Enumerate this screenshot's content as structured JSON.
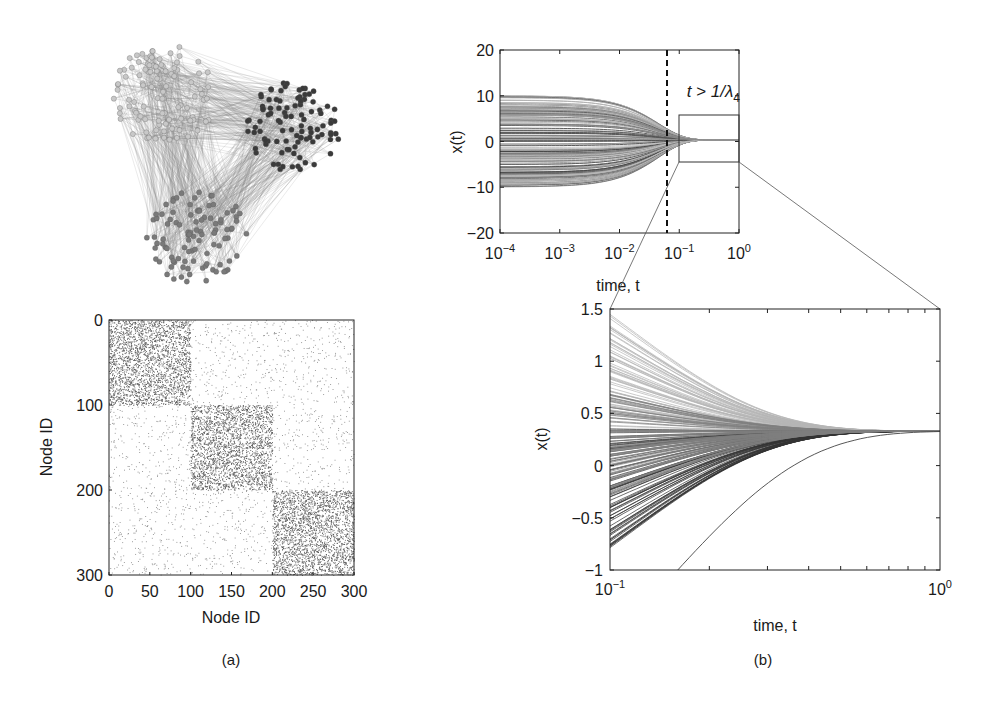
{
  "panels": {
    "a": {
      "label": "(a)"
    },
    "b": {
      "label": "(b)"
    }
  },
  "chart_data": [
    {
      "id": "network",
      "type": "network",
      "title": "",
      "communities": [
        {
          "name": "community-1",
          "nodes": 100,
          "node_color": "#c8c8c8",
          "cx": 165,
          "cy": 95,
          "r": 50
        },
        {
          "name": "community-2",
          "nodes": 100,
          "node_color": "#3a3a3a",
          "cx": 293,
          "cy": 127,
          "r": 45
        },
        {
          "name": "community-3",
          "nodes": 100,
          "node_color": "#7a7a7a",
          "cx": 197,
          "cy": 237,
          "r": 48
        }
      ],
      "edge_color": "#8a8a8a"
    },
    {
      "id": "adjacency",
      "type": "heatmap",
      "title": "",
      "xlabel": "Node ID",
      "ylabel": "Node ID",
      "xlim": [
        0,
        300
      ],
      "ylim": [
        0,
        300
      ],
      "y_inverted": true,
      "xticks": [
        0,
        50,
        100,
        150,
        200,
        250,
        300
      ],
      "yticks": [
        0,
        100,
        200,
        300
      ],
      "blocks": [
        {
          "rows": [
            0,
            100
          ],
          "cols": [
            0,
            100
          ],
          "density": "high"
        },
        {
          "rows": [
            100,
            200
          ],
          "cols": [
            100,
            200
          ],
          "density": "high"
        },
        {
          "rows": [
            200,
            300
          ],
          "cols": [
            200,
            300
          ],
          "density": "high"
        }
      ],
      "off_block_density": "low"
    },
    {
      "id": "consensus-full",
      "type": "line",
      "title": "",
      "xlabel": "time, t",
      "ylabel": "x(t)",
      "xscale": "log",
      "xlim": [
        0.0001,
        1
      ],
      "ylim": [
        -20,
        20
      ],
      "xticks": [
        "10^-4",
        "10^-3",
        "10^-2",
        "10^-1",
        "10^0"
      ],
      "yticks": [
        20,
        10,
        0,
        -10,
        -20
      ],
      "initial_value_range": [
        -10,
        10
      ],
      "final_value": 0.33,
      "annotations": [
        {
          "type": "vline",
          "x": 0.07,
          "style": "dashed"
        },
        {
          "type": "text",
          "text_main": "t > 1/λ",
          "text_sub": "4"
        },
        {
          "type": "zoom-box",
          "x": [
            0.1,
            1
          ],
          "y": [
            -4.5,
            5.5
          ]
        }
      ]
    },
    {
      "id": "consensus-zoom",
      "type": "line",
      "title": "",
      "xlabel": "time, t",
      "ylabel": "x(t)",
      "xscale": "log",
      "xlim": [
        0.1,
        1
      ],
      "ylim": [
        -1,
        1.5
      ],
      "xticks": [
        "10^-1",
        "10^0"
      ],
      "yticks": [
        1.5,
        1,
        0.5,
        0,
        -0.5,
        -1
      ],
      "series_groups": [
        {
          "name": "community-1",
          "color": "#b5b5b5",
          "start_range": [
            0.35,
            1.45
          ]
        },
        {
          "name": "community-2",
          "color": "#333333",
          "start_range": [
            -0.8,
            0.35
          ]
        },
        {
          "name": "community-3",
          "color": "#7f7f7f",
          "start_range": [
            -0.3,
            0.7
          ]
        }
      ],
      "outlier_start": -1.7,
      "final_value": 0.33
    }
  ]
}
